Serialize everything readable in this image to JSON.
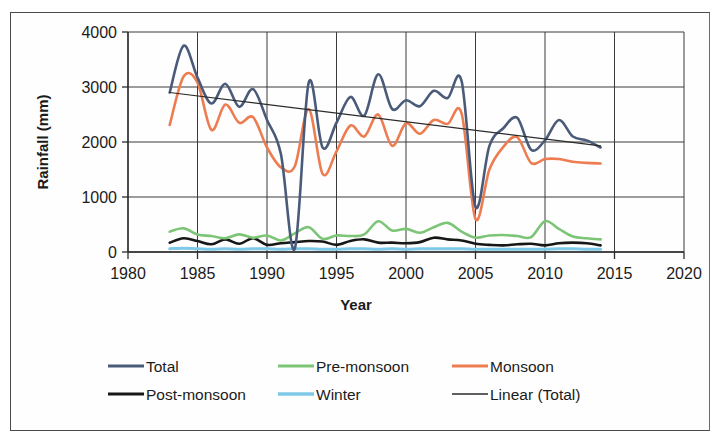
{
  "chart_data": {
    "type": "line",
    "title": "",
    "xlabel": "Year",
    "ylabel": "Rainfall (mm)",
    "xlim": [
      1980,
      2020
    ],
    "ylim": [
      0,
      4000
    ],
    "xticks": [
      1980,
      1985,
      1990,
      1995,
      2000,
      2005,
      2010,
      2015,
      2020
    ],
    "yticks": [
      0,
      1000,
      2000,
      3000,
      4000
    ],
    "grid": "both",
    "legend_position": "bottom",
    "x": [
      1983,
      1984,
      1985,
      1986,
      1987,
      1988,
      1989,
      1990,
      1991,
      1992,
      1993,
      1994,
      1995,
      1996,
      1997,
      1998,
      1999,
      2000,
      2001,
      2002,
      2003,
      2004,
      2005,
      2006,
      2007,
      2008,
      2009,
      2010,
      2011,
      2012,
      2013,
      2014
    ],
    "series": [
      {
        "name": "Total",
        "color": "#4a5b7a",
        "width": 2.6,
        "values": [
          2900,
          3750,
          3170,
          2700,
          3060,
          2640,
          2960,
          2400,
          1780,
          60,
          3080,
          1900,
          2350,
          2820,
          2480,
          3230,
          2600,
          2760,
          2650,
          2930,
          2800,
          3110,
          820,
          1930,
          2250,
          2440,
          1860,
          2030,
          2400,
          2100,
          2030,
          1900
        ]
      },
      {
        "name": "Pre-monsoon",
        "color": "#7cc576",
        "width": 2.6,
        "values": [
          370,
          430,
          320,
          290,
          250,
          320,
          260,
          300,
          210,
          340,
          450,
          240,
          300,
          290,
          320,
          560,
          390,
          420,
          350,
          450,
          530,
          370,
          260,
          300,
          310,
          290,
          270,
          560,
          420,
          280,
          250,
          230
        ]
      },
      {
        "name": "Monsoon",
        "color": "#ed7d51",
        "width": 2.6,
        "values": [
          2310,
          3190,
          3080,
          2220,
          2680,
          2350,
          2450,
          1900,
          1540,
          1560,
          2600,
          1420,
          1830,
          2300,
          2100,
          2500,
          1930,
          2340,
          2150,
          2400,
          2330,
          2520,
          600,
          1500,
          1910,
          2090,
          1620,
          1690,
          1690,
          1640,
          1620,
          1610
        ]
      },
      {
        "name": "Post-monsoon",
        "color": "#171717",
        "width": 2.6,
        "values": [
          170,
          250,
          200,
          140,
          230,
          150,
          250,
          130,
          160,
          180,
          200,
          190,
          130,
          200,
          230,
          170,
          170,
          160,
          180,
          260,
          230,
          210,
          150,
          130,
          120,
          140,
          150,
          120,
          160,
          170,
          160,
          120
        ]
      },
      {
        "name": "Winter",
        "color": "#7ec8e8",
        "width": 3.0,
        "values": [
          60,
          70,
          60,
          50,
          60,
          50,
          60,
          60,
          50,
          60,
          60,
          50,
          50,
          60,
          60,
          50,
          60,
          50,
          60,
          60,
          60,
          60,
          50,
          50,
          50,
          50,
          50,
          50,
          60,
          60,
          50,
          50
        ]
      }
    ],
    "trendline": {
      "name": "Linear (Total)",
      "color": "#2b2b2b",
      "width": 1.2,
      "x_start": 1983,
      "x_end": 2014,
      "y_start": 2900,
      "y_end": 1930
    }
  },
  "legend": {
    "items": [
      {
        "label": "Total",
        "color": "#4a5b7a",
        "row": 0,
        "col": 0
      },
      {
        "label": "Pre-monsoon",
        "color": "#7cc576",
        "row": 0,
        "col": 1
      },
      {
        "label": "Monsoon",
        "color": "#ed7d51",
        "row": 0,
        "col": 2
      },
      {
        "label": "Post-monsoon",
        "color": "#171717",
        "row": 1,
        "col": 0
      },
      {
        "label": "Winter",
        "color": "#7ec8e8",
        "row": 1,
        "col": 1
      },
      {
        "label": "Linear (Total)",
        "color": "#2b2b2b",
        "row": 1,
        "col": 2
      }
    ]
  },
  "axes": {
    "y_title": "Rainfall (mm)",
    "x_title": "Year",
    "y_tick_labels": [
      "4000",
      "3000",
      "2000",
      "1000",
      "0"
    ],
    "x_tick_labels": [
      "1980",
      "1985",
      "1990",
      "1995",
      "2000",
      "2005",
      "2010",
      "2015",
      "2020"
    ]
  }
}
